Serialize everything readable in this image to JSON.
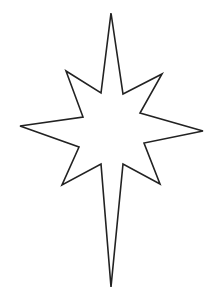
{
  "image": {
    "width": 223,
    "height": 307,
    "background": "#ffffff",
    "subject": "eight-point star outline (Bethlehem star) with elongated top and bottom points"
  },
  "star": {
    "stroke": "#222222",
    "stroke_width": 1.6,
    "fill": "#ffffff",
    "points": "111,13 123,94 162,74 140,113 203,131 144,143 160,184 123,164 111,287 101,164 62,185 79,147 20,126 83,117 66,71 101,93"
  }
}
